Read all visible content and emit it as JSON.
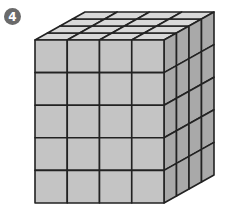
{
  "problem": {
    "number": "4"
  },
  "figure": {
    "type": "rectangular-prism-of-unit-cubes",
    "dimensions": {
      "width": 4,
      "height": 5,
      "depth": 4
    },
    "front": {
      "x": 35,
      "y": 40,
      "w": 129,
      "h": 163
    },
    "depth_offset": {
      "dx": 50,
      "dy": -28
    },
    "colors": {
      "top": "#d9d9d9",
      "front": "#c4c4c4",
      "side": "#a9a9a9",
      "stroke": "#222222"
    }
  }
}
